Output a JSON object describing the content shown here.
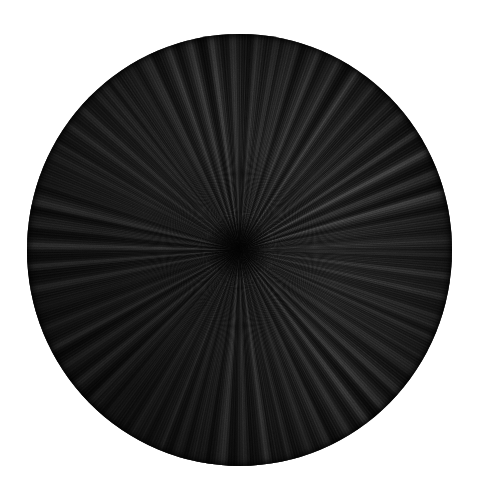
{
  "image": {
    "domain": "Natural-Image",
    "subject": "radial-burst-disc",
    "medium": "graphite drawing on paper",
    "background_color": "#ffffff",
    "has_text": false,
    "has_signature": false,
    "width": 480,
    "height": 497
  },
  "disc": {
    "shape": "ellipse",
    "left": 27,
    "top": 34,
    "width": 425,
    "height": 432,
    "fill_color": "#0b0b0b",
    "darkest_color": "#050505",
    "highlight_color": "#4a4a4a",
    "convergence_point": {
      "x": 238,
      "y": 248
    },
    "convergence_point_pct": {
      "x": "49.6%",
      "y": "49.5%"
    },
    "description": "Dense black disc filled with fine graphite strokes radiating outward from an off-center vanishing point."
  },
  "texture": {
    "type": "radial-striation",
    "stroke_count_estimate": 1200,
    "ray_bands": [
      {
        "name": "fine",
        "period_deg": 1.5,
        "highlight_alpha": 0.075
      },
      {
        "name": "medium",
        "period_deg": 5.8,
        "highlight_alpha": 0.105
      },
      {
        "name": "broad",
        "period_deg": 12.3,
        "highlight_alpha": 0.085
      },
      {
        "name": "dark",
        "period_deg": 13.7,
        "shadow_alpha": 0.55
      }
    ],
    "grain": {
      "type": "fractal-noise",
      "frequency": 0.9,
      "octaves": 4,
      "opacity": 0.4
    },
    "density_note": "Densest and darkest at the convergence point and toward the lower-left quadrant."
  }
}
